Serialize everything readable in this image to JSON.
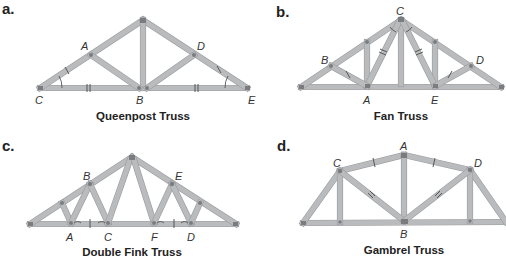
{
  "panels": [
    {
      "letter": "a.",
      "title": "Queenpost Truss",
      "labels": {
        "A": "A",
        "B": "B",
        "C": "C",
        "D": "D",
        "E": "E"
      }
    },
    {
      "letter": "b.",
      "title": "Fan Truss",
      "labels": {
        "A": "A",
        "B": "B",
        "C": "C",
        "D": "D",
        "E": "E"
      }
    },
    {
      "letter": "c.",
      "title": "Double Fink Truss",
      "labels": {
        "A": "A",
        "B": "B",
        "C": "C",
        "D": "D",
        "E": "E",
        "F": "F"
      }
    },
    {
      "letter": "d.",
      "title": "Gambrel Truss",
      "labels": {
        "A": "A",
        "B": "B",
        "C": "C",
        "D": "D"
      }
    }
  ],
  "colors": {
    "member": "#b9bbbd",
    "node": "#7a7c80",
    "text": "#222222"
  }
}
